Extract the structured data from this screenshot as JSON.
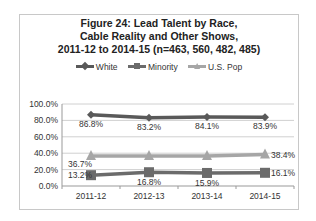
{
  "chart_data": {
    "type": "line",
    "title": "Figure 24: Lead Talent by Race, Cable Reality and Other Shows, 2011-12 to 2014-15 (n=463, 560, 482, 485)",
    "title_lines": [
      "Figure 24:  Lead Talent by Race,",
      "Cable Reality and Other Shows,",
      "2011-12 to 2014-15 (n=463, 560, 482, 485)"
    ],
    "categories": [
      "2011-12",
      "2012-13",
      "2013-14",
      "2014-15"
    ],
    "series": [
      {
        "name": "White",
        "values": [
          86.8,
          83.2,
          84.1,
          83.9
        ],
        "labels": [
          "86.8%",
          "83.2%",
          "84.1%",
          "83.9%"
        ],
        "color": "#595959",
        "marker": "diamond"
      },
      {
        "name": "Minority",
        "values": [
          13.2,
          16.8,
          15.9,
          16.1
        ],
        "labels": [
          "13.2%",
          "16.8%",
          "15.9%",
          "16.1%"
        ],
        "color": "#6b6b6b",
        "marker": "square"
      },
      {
        "name": "U.S. Pop",
        "values": [
          36.7,
          36.7,
          36.7,
          38.4
        ],
        "labels": [
          "36.7%",
          "",
          "",
          "38.4%"
        ],
        "color": "#a6a6a6",
        "marker": "triangle"
      }
    ],
    "yticks": [
      "100.0%",
      "80.0%",
      "60.0%",
      "40.0%",
      "20.0%",
      "0.0%"
    ],
    "ylim": [
      0,
      100
    ],
    "xlabel": "",
    "ylabel": "",
    "grid": true,
    "legend_position": "top"
  }
}
